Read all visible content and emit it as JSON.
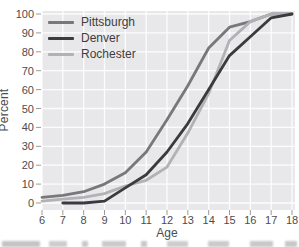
{
  "chart_data": {
    "type": "line",
    "title": "",
    "xlabel": "Age",
    "ylabel": "Percent",
    "xlim": [
      6,
      18
    ],
    "ylim": [
      0,
      100
    ],
    "grid": true,
    "legend_position": "top-left",
    "x": [
      6,
      7,
      8,
      9,
      10,
      11,
      12,
      13,
      14,
      15,
      16,
      17,
      18
    ],
    "x_ticks": [
      "6",
      "7",
      "8",
      "9",
      "10",
      "11",
      "12",
      "13",
      "14",
      "15",
      "16",
      "17",
      "18"
    ],
    "y_ticks": [
      "0",
      "10",
      "20",
      "30",
      "40",
      "50",
      "60",
      "70",
      "80",
      "90",
      "100"
    ],
    "plot_background": "#e8e8ea",
    "gridline_color": "#ffffff",
    "tick_color": "#9a9a9c",
    "text_color": "#4c4c4e",
    "series": [
      {
        "name": "Pittsburgh",
        "color": "#77787b",
        "values": [
          3,
          4,
          6,
          10,
          16,
          27,
          44,
          62,
          82,
          93,
          96,
          100,
          100
        ]
      },
      {
        "name": "Denver",
        "color": "#3b3b3d",
        "values": [
          null,
          0,
          0,
          1,
          8,
          15,
          27,
          42,
          60,
          78,
          88,
          98,
          100
        ]
      },
      {
        "name": "Rochester",
        "color": "#b1b2b5",
        "values": [
          1,
          2,
          3,
          5,
          9,
          12,
          19,
          37,
          58,
          86,
          96,
          100,
          100
        ]
      }
    ]
  }
}
